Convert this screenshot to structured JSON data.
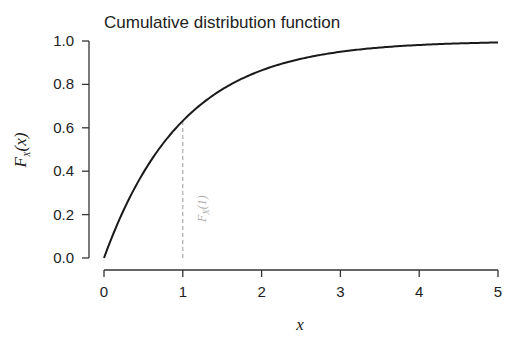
{
  "chart_data": {
    "type": "line",
    "title": "Cumulative distribution function",
    "xlabel": "x",
    "ylabel": "F_X(x)",
    "xlim": [
      0,
      5
    ],
    "ylim": [
      0,
      1
    ],
    "x_ticks": [
      "0",
      "1",
      "2",
      "3",
      "4",
      "5"
    ],
    "y_ticks": [
      "0.0",
      "0.2",
      "0.4",
      "0.6",
      "0.8",
      "1.0"
    ],
    "grid": false,
    "legend": null,
    "series": [
      {
        "name": "F_X(x) = 1 - exp(-x)",
        "x": [
          0,
          0.25,
          0.5,
          0.75,
          1,
          1.5,
          2,
          2.5,
          3,
          3.5,
          4,
          4.5,
          5
        ],
        "y": [
          0.0,
          0.221,
          0.393,
          0.528,
          0.632,
          0.777,
          0.865,
          0.918,
          0.95,
          0.97,
          0.982,
          0.989,
          0.993
        ]
      }
    ],
    "annotations": [
      {
        "type": "vertical-dashed-line",
        "x": 1,
        "y_from": 0,
        "y_to": 0.632,
        "label": "F_X(1)"
      }
    ]
  },
  "labels": {
    "title": "Cumulative distribution function",
    "xlabel": "x",
    "ylabel_main": "F",
    "ylabel_sub": "X",
    "ylabel_arg": "(x)",
    "annot_main": "F",
    "annot_sub": "X",
    "annot_arg": "(1)",
    "xticks": [
      "0",
      "1",
      "2",
      "3",
      "4",
      "5"
    ],
    "yticks": [
      "0.0",
      "0.2",
      "0.4",
      "0.6",
      "0.8",
      "1.0"
    ]
  },
  "colors": {
    "curve": "#1a1a1a",
    "axis": "#333333",
    "annotation": "#999999"
  }
}
